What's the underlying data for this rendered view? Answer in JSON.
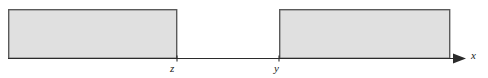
{
  "figure": {
    "background_color": "#ffffff",
    "axis": {
      "name": "x-axis",
      "label": "x",
      "line_color": "#2b2b2b",
      "line_width": 1,
      "baseline_y": 58,
      "start_x": 8,
      "end_x": 466,
      "arrowhead": "right-arrow-icon"
    },
    "ticks": [
      {
        "label": "z",
        "x": 177
      },
      {
        "label": "y",
        "x": 279
      }
    ],
    "regions": [
      {
        "name": "left-shaded-region",
        "x": 8,
        "y": 9,
        "width": 169,
        "height": 49,
        "fill_color": "#e0e0e0",
        "stroke_color": "#5a5a5a",
        "stroke_width": 1.4
      },
      {
        "name": "right-shaded-region",
        "x": 279,
        "y": 9,
        "width": 171,
        "height": 49,
        "fill_color": "#e0e0e0",
        "stroke_color": "#5a5a5a",
        "stroke_width": 1.4
      }
    ]
  }
}
